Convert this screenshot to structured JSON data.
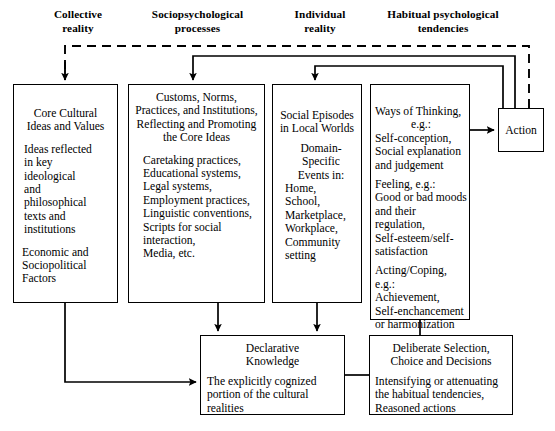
{
  "diagram": {
    "headers": [
      {
        "id": "collective-reality",
        "label": "Collective\nreality"
      },
      {
        "id": "sociopsychological-processes",
        "label": "Sociopsychological\nprocesses"
      },
      {
        "id": "individual-reality",
        "label": "Individual\nreality"
      },
      {
        "id": "habitual-psychological-tendencies",
        "label": "Habitual psychological\ntendencies"
      }
    ],
    "boxes": {
      "core": {
        "title": "Core Cultural\nIdeas and Values",
        "body1": "Ideas reflected\nin key\nideological\nand\nphilosophical\ntexts and\ninstitutions",
        "body2": "Economic and\nSociopolitical\nFactors"
      },
      "customs": {
        "title": "Customs, Norms,\nPractices, and Institutions,\nReflecting and Promoting\nthe Core Ideas",
        "body1": "Caretaking practices,\nEducational systems,\nLegal systems,\nEmployment practices,\nLinguistic conventions,\nScripts for social\ninteraction,\nMedia, etc."
      },
      "social": {
        "title": "Social Episodes\nin Local Worlds",
        "subtitle": "Domain-Specific\nEvents in:",
        "body1": "Home,\nSchool,\nMarketplace,\nWorkplace,\nCommunity\nsetting"
      },
      "ways": {
        "body1": "Ways of Thinking,",
        "body1b": "e.g.:",
        "body2": "Self-conception,\nSocial explanation\nand judgement",
        "body3": "Feeling, e.g.:\nGood or bad moods\nand their regulation,\nSelf-esteem/self-\nsatisfaction",
        "body4": "Acting/Coping, e.g.:\nAchievement,\nSelf-enchancement\nor harmonization"
      },
      "action": {
        "label": "Action"
      },
      "declarative": {
        "title": "Declarative\nKnowledge",
        "body1": "The explicitly cognized\nportion of the cultural\nrealities"
      },
      "deliberate": {
        "title": "Deliberate Selection,\nChoice and Decisions",
        "body1": "Intensifying  or attenuating\nthe habitual tendencies,",
        "body2": "Reasoned actions"
      }
    },
    "connectors": [
      {
        "id": "dashed-feedback-to-collective",
        "style": "dashed",
        "from": "action",
        "to": "core"
      },
      {
        "id": "feedback-to-sociopsychological",
        "style": "solid",
        "from": "action",
        "to": "customs"
      },
      {
        "id": "feedback-to-individual",
        "style": "solid",
        "from": "action",
        "to": "social"
      },
      {
        "id": "core-to-customs",
        "style": "solid"
      },
      {
        "id": "core-to-declarative",
        "style": "solid"
      },
      {
        "id": "customs-to-declarative",
        "style": "solid"
      },
      {
        "id": "social-to-declarative",
        "style": "solid"
      },
      {
        "id": "ways-to-action",
        "style": "solid"
      },
      {
        "id": "ways-to-deliberate",
        "style": "solid"
      },
      {
        "id": "declarative-to-deliberate",
        "style": "solid"
      }
    ],
    "colors": {
      "stroke": "#000000",
      "background": "#ffffff"
    }
  }
}
